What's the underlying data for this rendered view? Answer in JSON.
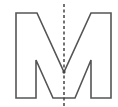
{
  "figure": {
    "letter": "M",
    "colors": {
      "background": "#ffffff",
      "outline": "#555555",
      "symmetry_line": "#444444"
    }
  }
}
